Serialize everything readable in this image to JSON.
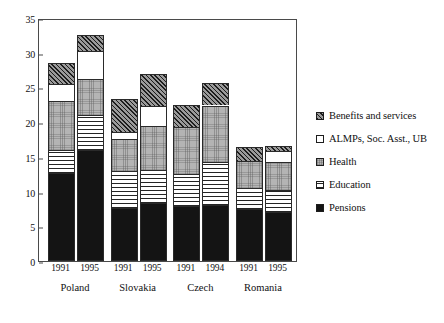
{
  "chart_data": {
    "type": "bar",
    "subtype": "stacked-bar",
    "title": "",
    "xlabel": "",
    "ylabel": "",
    "ylim": [
      0,
      35
    ],
    "ytick_values": [
      0,
      5,
      10,
      15,
      20,
      25,
      30,
      35
    ],
    "ytick_labels": [
      "0",
      "5",
      "10",
      "15",
      "20",
      "25",
      "30",
      "35"
    ],
    "grid": false,
    "legend_position": "right",
    "categories": [
      "Poland 1991",
      "Poland 1995",
      "Slovakia 1991",
      "Slovakia 1995",
      "Czech 1991",
      "Czech 1994",
      "Romania 1991",
      "Romania 1995"
    ],
    "groups": [
      {
        "country": "Poland",
        "bars": [
          {
            "year": "1991",
            "total": 28.5,
            "segments": [
              {
                "key": "pensions",
                "value": 12.7
              },
              {
                "key": "education",
                "value": 3.3
              },
              {
                "key": "health",
                "value": 7.0
              },
              {
                "key": "almps",
                "value": 2.5
              },
              {
                "key": "benefits",
                "value": 3.0
              }
            ]
          },
          {
            "year": "1995",
            "total": 32.5,
            "segments": [
              {
                "key": "pensions",
                "value": 16.0
              },
              {
                "key": "education",
                "value": 5.0
              },
              {
                "key": "health",
                "value": 5.2
              },
              {
                "key": "almps",
                "value": 4.1
              },
              {
                "key": "benefits",
                "value": 2.2
              }
            ]
          }
        ]
      },
      {
        "country": "Slovakia",
        "bars": [
          {
            "year": "1991",
            "total": 23.4,
            "segments": [
              {
                "key": "pensions",
                "value": 7.6
              },
              {
                "key": "education",
                "value": 5.4
              },
              {
                "key": "health",
                "value": 4.6
              },
              {
                "key": "almps",
                "value": 1.0
              },
              {
                "key": "benefits",
                "value": 4.8
              }
            ]
          },
          {
            "year": "1995",
            "total": 27.0,
            "segments": [
              {
                "key": "pensions",
                "value": 8.3
              },
              {
                "key": "education",
                "value": 4.8
              },
              {
                "key": "health",
                "value": 6.4
              },
              {
                "key": "almps",
                "value": 2.8
              },
              {
                "key": "benefits",
                "value": 4.7
              }
            ]
          }
        ]
      },
      {
        "country": "Czech",
        "bars": [
          {
            "year": "1991",
            "total": 22.5,
            "segments": [
              {
                "key": "pensions",
                "value": 7.9
              },
              {
                "key": "education",
                "value": 4.6
              },
              {
                "key": "health",
                "value": 6.8
              },
              {
                "key": "almps",
                "value": 0.0
              },
              {
                "key": "benefits",
                "value": 3.2
              }
            ]
          },
          {
            "year": "1994",
            "total": 25.6,
            "segments": [
              {
                "key": "pensions",
                "value": 8.1
              },
              {
                "key": "education",
                "value": 6.1
              },
              {
                "key": "health",
                "value": 8.2
              },
              {
                "key": "almps",
                "value": 0.0
              },
              {
                "key": "benefits",
                "value": 3.2
              }
            ]
          }
        ]
      },
      {
        "country": "Romania",
        "bars": [
          {
            "year": "1991",
            "total": 16.4,
            "segments": [
              {
                "key": "pensions",
                "value": 7.5
              },
              {
                "key": "education",
                "value": 3.0
              },
              {
                "key": "health",
                "value": 3.9
              },
              {
                "key": "almps",
                "value": 0.0
              },
              {
                "key": "benefits",
                "value": 2.0
              }
            ]
          },
          {
            "year": "1995",
            "total": 16.6,
            "segments": [
              {
                "key": "pensions",
                "value": 7.0
              },
              {
                "key": "education",
                "value": 3.3
              },
              {
                "key": "health",
                "value": 4.0
              },
              {
                "key": "almps",
                "value": 1.6
              },
              {
                "key": "benefits",
                "value": 0.7
              }
            ]
          }
        ]
      }
    ],
    "series": [
      {
        "name": "Pensions",
        "key": "pensions",
        "values": [
          12.7,
          16.0,
          7.6,
          8.3,
          7.9,
          8.1,
          7.5,
          7.0
        ]
      },
      {
        "name": "Education",
        "key": "education",
        "values": [
          3.3,
          5.0,
          5.4,
          4.8,
          4.6,
          6.1,
          3.0,
          3.3
        ]
      },
      {
        "name": "Health",
        "key": "health",
        "values": [
          7.0,
          5.2,
          4.6,
          6.4,
          6.8,
          8.2,
          3.9,
          4.0
        ]
      },
      {
        "name": "ALMPs, Soc. Asst., UB",
        "key": "almps",
        "values": [
          2.5,
          4.1,
          1.0,
          2.8,
          0.0,
          0.0,
          0.0,
          1.6
        ]
      },
      {
        "name": "Benefits and services",
        "key": "benefits",
        "values": [
          3.0,
          2.2,
          4.8,
          4.7,
          3.2,
          3.2,
          2.0,
          0.7
        ]
      }
    ],
    "legend": [
      {
        "label": "Benefits and services",
        "key": "benefits",
        "swatch": "diagonal-hatch"
      },
      {
        "label": "ALMPs, Soc. Asst., UB",
        "key": "almps",
        "swatch": "white"
      },
      {
        "label": "Health",
        "key": "health",
        "swatch": "gray-stipple"
      },
      {
        "label": "Education",
        "key": "education",
        "swatch": "horizontal-lines"
      },
      {
        "label": "Pensions",
        "key": "pensions",
        "swatch": "solid-black"
      }
    ],
    "colors": {
      "benefits": "#9a9a9a",
      "almps": "#ffffff",
      "health": "#b4b4b4",
      "education": "#ffffff",
      "pensions": "#141414",
      "axis": "#4a4a4a",
      "outline": "#2a2a2a",
      "background": "#ffffff"
    }
  }
}
